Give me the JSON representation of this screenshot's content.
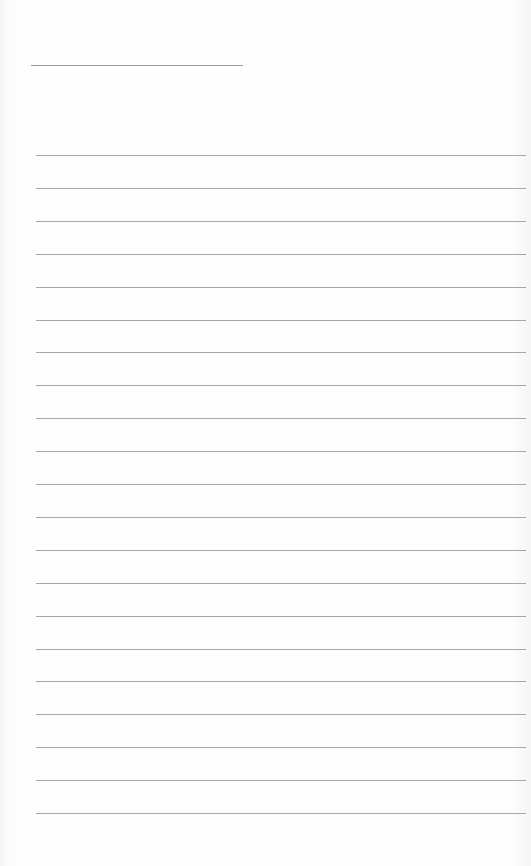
{
  "page": {
    "type": "blank-lined-paper",
    "header_line": {
      "left": 31,
      "top": 65,
      "width": 212
    },
    "rules": {
      "count": 21,
      "first_top": 155,
      "spacing": 32.9,
      "left": 36,
      "width": 490
    },
    "line_color": "#a8a8a8",
    "paper_color": "#fdfdfd"
  }
}
